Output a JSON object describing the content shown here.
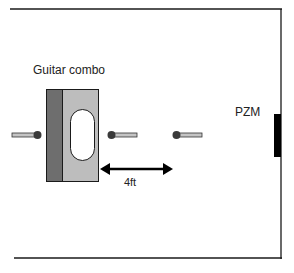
{
  "diagram": {
    "labels": {
      "amp": "Guitar combo",
      "distance": "4ft",
      "boundary_mic": "PZM"
    },
    "colors": {
      "line": "#1a1a1a",
      "amp_dark": "#6e6e6e",
      "amp_light": "#bdbdbd",
      "mic_ball": "#3a3a3a",
      "mic_body": "#c4c4c4",
      "pzm": "#000000"
    },
    "mics": [
      {
        "position": "behind-amp",
        "direction": "pointing-right"
      },
      {
        "position": "front-close",
        "direction": "pointing-left"
      },
      {
        "position": "front-4ft",
        "direction": "pointing-left"
      }
    ]
  }
}
